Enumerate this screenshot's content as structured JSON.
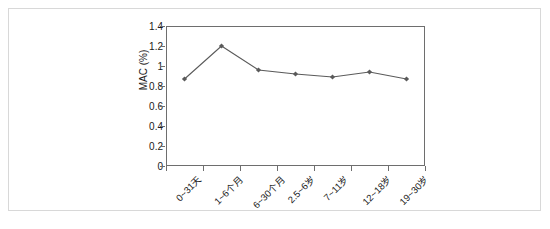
{
  "figure": {
    "border_color": "#d8d8d8",
    "background": "#ffffff"
  },
  "chart_data": {
    "type": "line",
    "title": "",
    "xlabel": "",
    "ylabel": "MAC (%)",
    "categories": [
      "0~31天",
      "1~6个月",
      "6~30个月",
      "2.5~6岁",
      "7~11岁",
      "12~18岁",
      "19~30岁"
    ],
    "values": [
      0.87,
      1.2,
      0.96,
      0.92,
      0.89,
      0.94,
      0.87
    ],
    "series": [
      {
        "name": "MAC",
        "values": [
          0.87,
          1.2,
          0.96,
          0.92,
          0.89,
          0.94,
          0.87
        ]
      }
    ],
    "ylim": [
      0,
      1.4
    ],
    "ytick_labels": [
      "0",
      "0.2",
      "0.4",
      "0.6",
      "0.8",
      "1",
      "1.2",
      "1.4"
    ],
    "ytick_values": [
      0,
      0.2,
      0.4,
      0.6,
      0.8,
      1.0,
      1.2,
      1.4
    ],
    "grid": false,
    "legend": false,
    "legend_position": "none",
    "marker": "diamond",
    "line_color": "#5a5a5a",
    "marker_color": "#5a5a5a",
    "axis_color": "#6e6e6e"
  }
}
